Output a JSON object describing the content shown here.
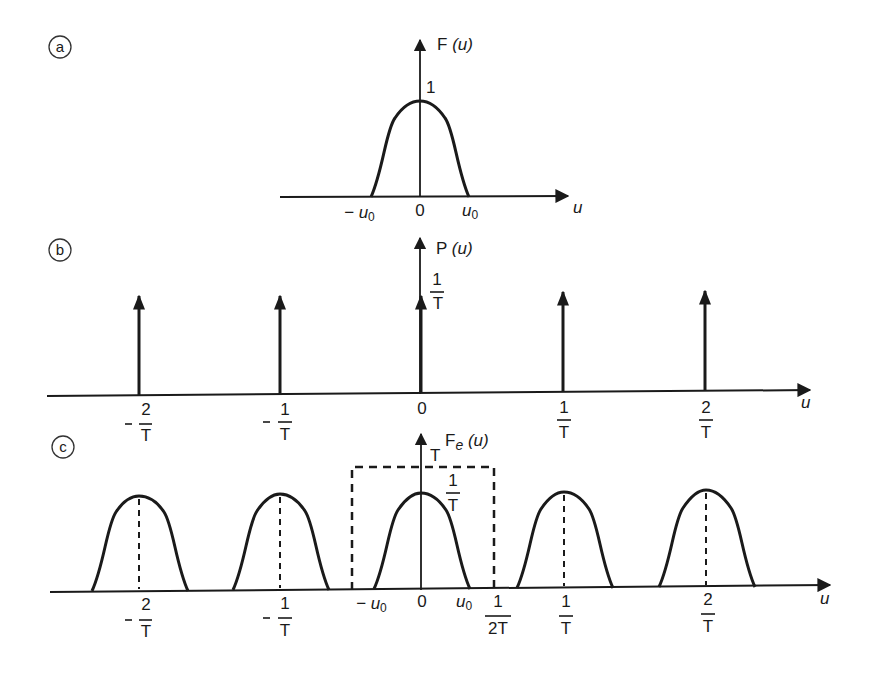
{
  "figure": {
    "panels": [
      {
        "id": "a",
        "letter": "a",
        "axis_label": "F (u)",
        "axis_label_main": "F",
        "axis_label_arg": "(u)",
        "peak_label": "1",
        "x_axis_label": "u",
        "ticks": [
          "−u0",
          "0",
          "u0"
        ],
        "tick_neg_u0_main": "− u",
        "tick_sub": "0",
        "tick_zero": "0",
        "tick_u0_main": "u"
      },
      {
        "id": "b",
        "letter": "b",
        "axis_label": "P (u)",
        "axis_label_main": "P",
        "axis_label_arg": "(u)",
        "impulse_height_num": "1",
        "impulse_height_den": "T",
        "x_axis_label": "u",
        "ticks": [
          {
            "sign": "−",
            "num": "2",
            "den": "T"
          },
          {
            "sign": "−",
            "num": "1",
            "den": "T"
          },
          {
            "sign": "",
            "num": "0",
            "den": ""
          },
          {
            "sign": "",
            "num": "1",
            "den": "T"
          },
          {
            "sign": "",
            "num": "2",
            "den": "T"
          }
        ]
      },
      {
        "id": "c",
        "letter": "c",
        "axis_label": "Fe (u)",
        "axis_label_main": "F",
        "axis_label_sub": "e",
        "axis_label_arg": "(u)",
        "filter_height_label": "T",
        "peak_num": "1",
        "peak_den": "T",
        "x_axis_label": "u",
        "center_ticks": {
          "neg_u0_main": "− u",
          "sub": "0",
          "zero": "0",
          "u0_main": "u"
        },
        "cutoff": {
          "num": "1",
          "den": "2T"
        },
        "ticks": [
          {
            "sign": "−",
            "num": "2",
            "den": "T"
          },
          {
            "sign": "−",
            "num": "1",
            "den": "T"
          },
          {
            "sign": "",
            "num": "1",
            "den": "T"
          },
          {
            "sign": "",
            "num": "2",
            "den": "T"
          }
        ]
      }
    ]
  }
}
